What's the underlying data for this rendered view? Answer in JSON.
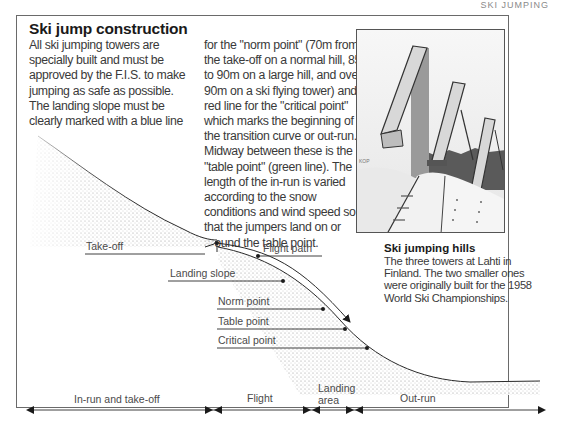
{
  "running_head": "SKI JUMPING",
  "article": {
    "title": "Ski jump construction",
    "column1_lines": [
      "All ski jumping towers are",
      "specially built and must be",
      "approved by the F.I.S. to make",
      "jumping as safe as possible.",
      "The landing slope must be",
      "clearly marked with a blue line"
    ],
    "column2_lines": [
      "for the \"norm point\" (70m from",
      "the take-off on a normal hill, 85",
      "to 90m on a large hill, and over",
      "90m on a ski flying tower) and a",
      "red line for the \"critical point\"",
      "which marks the beginning of",
      "the transition curve or out-run.",
      "Midway between these is the",
      "\"table point\" (green line). The",
      "length of the in-run is varied",
      "according to the snow",
      "conditions and wind speed so",
      "that the jumpers land on or",
      "around the table point."
    ]
  },
  "photo": {
    "alt": "Three ski jumping towers",
    "caption_title": "Ski jumping hills",
    "caption_lines": [
      "The three towers at Lahti in",
      "Finland. The two smaller ones",
      "were originally built for the 1958",
      "World Ski Championships."
    ]
  },
  "diagram": {
    "labels": {
      "take_off": "Take-off",
      "flight_path": "Flight path",
      "landing_slope": "Landing slope",
      "norm_point": "Norm point",
      "table_point": "Table point",
      "critical_point": "Critical point"
    },
    "zones": [
      {
        "label": "In-run and take-off"
      },
      {
        "label": "Flight"
      },
      {
        "label": "Landing",
        "label2": "area"
      },
      {
        "label": "Out-run"
      }
    ],
    "colors": {
      "line": "#2a2a2a",
      "stipple": "#9a9a9a"
    }
  }
}
